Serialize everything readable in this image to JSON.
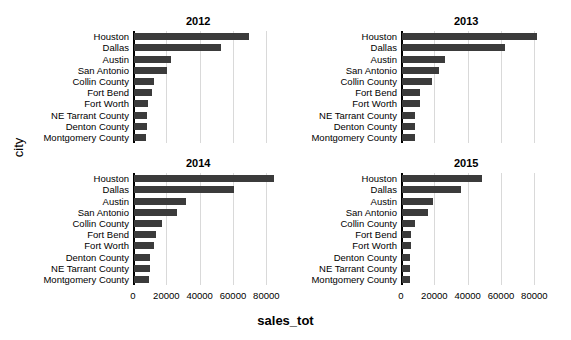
{
  "chart_data": {
    "type": "bar",
    "title": "",
    "xlabel": "sales_tot",
    "ylabel": "city",
    "orientation": "horizontal",
    "layout": "facet grid 2x2 by year",
    "grid": true,
    "legend": "none",
    "xlim": [
      0,
      90000
    ],
    "xticks": [
      0,
      20000,
      40000,
      60000,
      80000
    ],
    "xtick_labels": [
      "0",
      "20000",
      "40000",
      "60000",
      "80000"
    ],
    "bar_color": "#3b3b3b",
    "panels": [
      {
        "title": "2012",
        "categories": [
          "Houston",
          "Dallas",
          "Austin",
          "San Antonio",
          "Collin County",
          "Fort Bend",
          "Fort Worth",
          "NE Tarrant County",
          "Denton County",
          "Montgomery County"
        ],
        "values": [
          69000,
          52000,
          22000,
          20000,
          12000,
          11000,
          8500,
          7500,
          7500,
          7000
        ]
      },
      {
        "title": "2013",
        "categories": [
          "Houston",
          "Dallas",
          "Austin",
          "San Antonio",
          "Collin County",
          "Fort Bend",
          "Fort Worth",
          "NE Tarrant County",
          "Denton County",
          "Montgomery County"
        ],
        "values": [
          81000,
          62000,
          26000,
          22000,
          18000,
          11000,
          10500,
          7500,
          7500,
          7500
        ]
      },
      {
        "title": "2014",
        "categories": [
          "Houston",
          "Dallas",
          "Austin",
          "San Antonio",
          "Collin County",
          "Fort Bend",
          "Fort Worth",
          "Denton County",
          "NE Tarrant County",
          "Montgomery County"
        ],
        "values": [
          84000,
          60000,
          31000,
          26000,
          17000,
          13000,
          12000,
          9500,
          9500,
          9000
        ]
      },
      {
        "title": "2015",
        "categories": [
          "Houston",
          "Dallas",
          "Austin",
          "San Antonio",
          "Collin County",
          "Fort Bend",
          "Fort Worth",
          "Denton County",
          "NE Tarrant County",
          "Montgomery County"
        ],
        "values": [
          48000,
          35500,
          18500,
          15500,
          8000,
          5500,
          5500,
          5000,
          5000,
          5000
        ]
      }
    ]
  }
}
